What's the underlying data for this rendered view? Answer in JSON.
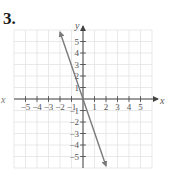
{
  "problem": {
    "number": "3."
  },
  "left_label": "x",
  "chart_data": {
    "type": "line",
    "title": "",
    "xlabel": "x",
    "ylabel": "y",
    "xlim": [
      -6,
      6
    ],
    "ylim": [
      -6,
      6
    ],
    "grid": true,
    "x_ticks": [
      -5,
      -4,
      -3,
      -2,
      -1,
      1,
      2,
      3,
      4,
      5
    ],
    "y_ticks": [
      5,
      4,
      3,
      2,
      1,
      -1,
      -2,
      -3,
      -4,
      -5
    ],
    "x_tick_labels": [
      "−5",
      "−4",
      "−3",
      "−2",
      "−1",
      "1",
      "2",
      "3",
      "4",
      "5"
    ],
    "y_tick_labels": [
      "5",
      "4",
      "3",
      "2",
      "1",
      "−1",
      "−2",
      "−3",
      "−4",
      "−5"
    ],
    "series": [
      {
        "name": "line",
        "equation": "y = -3x",
        "x": [
          -2,
          2
        ],
        "y": [
          6,
          -6
        ],
        "arrows": "both",
        "color": "#7a7a7a"
      }
    ],
    "colors": {
      "grid": "#e3e3e3",
      "axis": "#444444",
      "line": "#7a7a7a"
    }
  }
}
